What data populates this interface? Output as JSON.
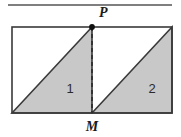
{
  "figure": {
    "canvas": {
      "width": 181,
      "height": 137,
      "background": "#ffffff"
    },
    "colors": {
      "stroke": "#3a3a3a",
      "shade_fill": "#c8c8c8",
      "shade_stroke": "#3a3a3a",
      "dashed_line": "#2e2e2e",
      "point_marker": "#111111",
      "top_rule": "#555555",
      "label_text": "#1a1a1a"
    },
    "top_rule": {
      "x1": 8,
      "y1": 5,
      "x2": 172,
      "y2": 5,
      "thickness": 1.6
    },
    "rectangle": {
      "left": 12,
      "top": 27,
      "right": 172,
      "bottom": 113,
      "stroke_width": 1.6,
      "fill": "none"
    },
    "points": [
      {
        "name": "P",
        "label": "P",
        "x": 92,
        "y": 27,
        "marker": true,
        "label_x": 99,
        "label_y": 17
      },
      {
        "name": "M",
        "label": "M",
        "x": 92,
        "y": 113,
        "marker": false,
        "label_x": 92,
        "label_y": 131
      }
    ],
    "dashed_segment": {
      "from": "P",
      "to": "M",
      "x1": 92,
      "y1": 27,
      "x2": 92,
      "y2": 113,
      "dash_pattern": "4,3",
      "stroke_width": 1.6
    },
    "triangles": [
      {
        "name": "triangle-one",
        "label": "1",
        "label_x": 70,
        "label_y": 93,
        "points": "12,113 92,27 92,113"
      },
      {
        "name": "triangle-two",
        "label": "2",
        "label_x": 152,
        "label_y": 93,
        "points": "92,113 172,27 172,113"
      }
    ]
  }
}
